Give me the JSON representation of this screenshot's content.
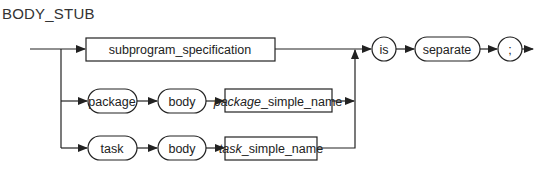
{
  "title": "BODY_STUB",
  "nodes": {
    "subprogram_specification": {
      "label": "subprogram_specification",
      "kind": "nonterminal"
    },
    "is": {
      "label": "is",
      "kind": "terminal"
    },
    "separate": {
      "label": "separate",
      "kind": "terminal"
    },
    "semicolon": {
      "label": ";",
      "kind": "terminal"
    },
    "package": {
      "label": "package",
      "kind": "terminal"
    },
    "package_body": {
      "label": "body",
      "kind": "terminal"
    },
    "package_simple_name": {
      "prefix": "package",
      "suffix": "_simple_name",
      "kind": "nonterminal"
    },
    "task": {
      "label": "task",
      "kind": "terminal"
    },
    "task_body": {
      "label": "body",
      "kind": "terminal"
    },
    "task_simple_name": {
      "prefix": "task",
      "suffix": "_simple_name",
      "kind": "nonterminal"
    }
  },
  "colors": {
    "stroke": "#222222",
    "text": "#222222",
    "background": "#ffffff"
  }
}
